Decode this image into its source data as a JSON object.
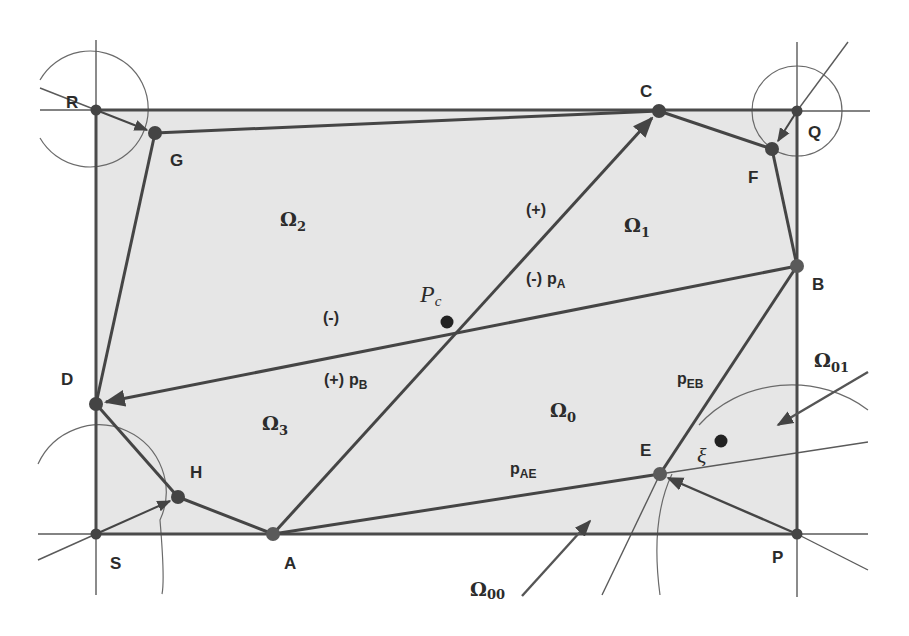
{
  "diagram": {
    "type": "geometric-partition",
    "colors": {
      "fill": "#e6e6e6",
      "stroke": "#4a4a4a",
      "thin": "#6a6a6a",
      "node": "#444444",
      "background": "#ffffff"
    },
    "points": {
      "R": "R",
      "G": "G",
      "C": "C",
      "Q": "Q",
      "F": "F",
      "B": "B",
      "D": "D",
      "H": "H",
      "S": "S",
      "A": "A",
      "E": "E",
      "P": "P"
    },
    "regions": {
      "omega0": {
        "base": "Ω",
        "sub": "0"
      },
      "omega1": {
        "base": "Ω",
        "sub": "1"
      },
      "omega2": {
        "base": "Ω",
        "sub": "2"
      },
      "omega3": {
        "base": "Ω",
        "sub": "3"
      },
      "omega01": {
        "base": "Ω",
        "sub": "01"
      },
      "omega00": {
        "base": "Ω",
        "sub": "00"
      }
    },
    "line_labels": {
      "plus_top": "(+)",
      "minus_pa_sign": "(-)",
      "pa_base": "p",
      "pa_sub": "A",
      "minus_left": "(-)",
      "plus_pb_sign": "(+)",
      "pb_base": "p",
      "pb_sub": "B",
      "peb_base": "p",
      "peb_sub": "EB",
      "pae_base": "p",
      "pae_sub": "AE"
    },
    "special_points": {
      "pc_base": "P",
      "pc_sub": "c",
      "xi": "ξ"
    }
  }
}
